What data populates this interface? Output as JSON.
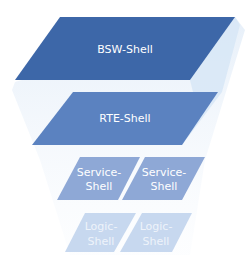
{
  "diagram": {
    "type": "layered-stack",
    "layers": [
      {
        "id": "bsw",
        "label": "BSW-Shell",
        "color": "#3d67a8"
      },
      {
        "id": "rte",
        "label": "RTE-Shell",
        "color": "#5b82c0"
      },
      {
        "id": "service",
        "items": [
          {
            "label_line1": "Service-",
            "label_line2": "Shell"
          },
          {
            "label_line1": "Service-",
            "label_line2": "Shell"
          }
        ],
        "color": "#8ea8d6"
      },
      {
        "id": "logic",
        "items": [
          {
            "label_line1": "Logic-",
            "label_line2": "Shell"
          },
          {
            "label_line1": "Logic-",
            "label_line2": "Shell"
          }
        ],
        "color": "#c7d8ef"
      }
    ]
  }
}
